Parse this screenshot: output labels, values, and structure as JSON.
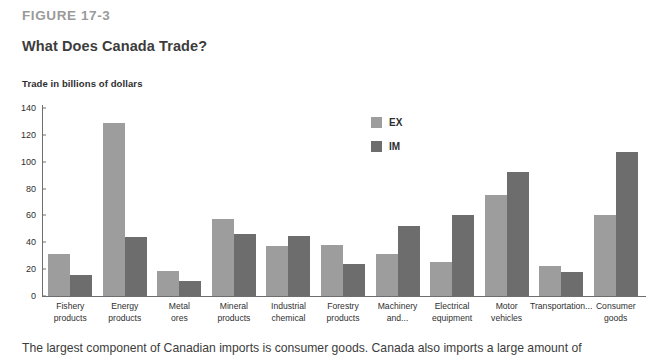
{
  "header": {
    "figure_label": "FIGURE 17-3",
    "title": "What Does Canada Trade?",
    "axis_caption": "Trade in billions of dollars"
  },
  "caption": "The largest component of Canadian imports is consumer goods. Canada also imports a large amount of",
  "colors": {
    "export_bar": "#9d9d9d",
    "import_bar": "#6d6d6d",
    "axis": "#6e6e6e",
    "figure_label": "#9a9a9a",
    "text": "#3c3c3c"
  },
  "chart_data": {
    "type": "bar",
    "title": "What Does Canada Trade?",
    "xlabel": "",
    "ylabel": "Trade in billions of dollars",
    "ylim": [
      0,
      140
    ],
    "yticks": [
      0,
      20,
      40,
      60,
      80,
      100,
      120,
      140
    ],
    "grid": false,
    "legend_position": "top-center",
    "categories": [
      "Fishery\nproducts",
      "Energy\nproducts",
      "Metal\nores",
      "Mineral\nproducts",
      "Industrial\nchemical",
      "Forestry\nproducts",
      "Machinery\nand...",
      "Electrical\nequipment",
      "Motor\nvehicles",
      "Transportation...",
      "Consumer\ngoods"
    ],
    "series": [
      {
        "name": "EX",
        "color": "#9d9d9d",
        "values": [
          31,
          129,
          19,
          57,
          37,
          38,
          31,
          25,
          75,
          22,
          60
        ]
      },
      {
        "name": "IM",
        "color": "#6d6d6d",
        "values": [
          16,
          44,
          11,
          46,
          45,
          24,
          52,
          60,
          92,
          18,
          107
        ]
      }
    ]
  }
}
